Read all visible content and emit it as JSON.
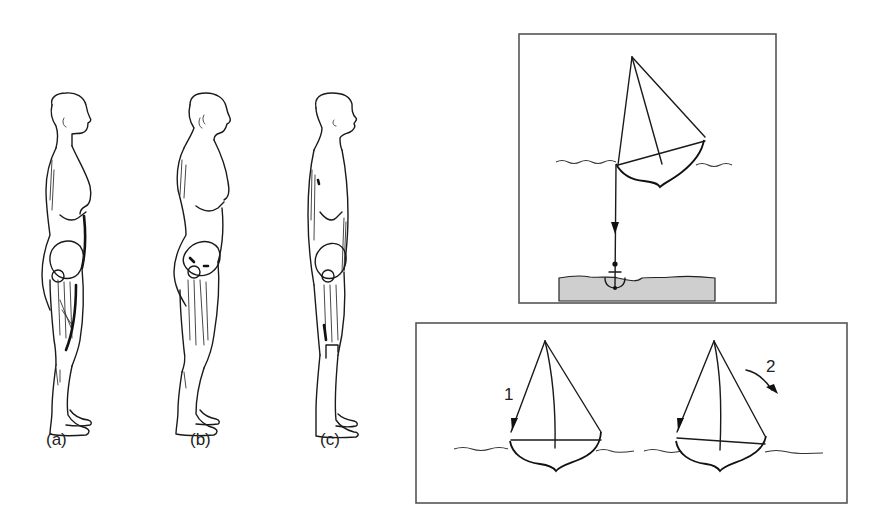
{
  "figure": {
    "posture_panel": {
      "figures": [
        {
          "id": "a",
          "label": "(a)"
        },
        {
          "id": "b",
          "label": "(b)"
        },
        {
          "id": "c",
          "label": "(c)"
        }
      ]
    },
    "anchored_boat_panel": {
      "elements": [
        "sailboat",
        "water-surface",
        "anchor-line-arrow",
        "anchor",
        "seabed"
      ]
    },
    "two_boats_panel": {
      "boats": [
        {
          "id": "boat-1",
          "arrow_label": "1"
        },
        {
          "id": "boat-2",
          "arrow_label": "2"
        }
      ]
    },
    "colors": {
      "line": "#1a1a1a",
      "frame": "#555555",
      "seabed": "#cfcfcf",
      "background": "#ffffff"
    }
  }
}
